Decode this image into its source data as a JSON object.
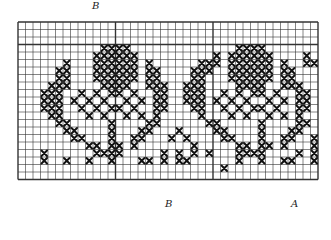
{
  "diagram": {
    "labels": {
      "top_b": "B",
      "bottom_b": "B",
      "bottom_a": "A"
    },
    "grid": {
      "cols": 40,
      "rows": 21,
      "cell_size": 7.5,
      "line_color": "#333333",
      "stitch_color": "#111111",
      "bold_every_col": [
        0,
        13,
        26,
        40
      ],
      "bold_row": 3
    },
    "pattern_rows": [
      "........................................",
      "........................................",
      "........................................",
      "...........XXXX..............XXXX.......",
      "..........XXXXXX..........X.XXXXXX....X.",
      "......X...XXXXXX.X......XXX.XXXXXX.X..XX",
      ".....XX...XXXXXX.XX....XXX..XXXXXX.XX...",
      ".....XX...XXXXXX.XX....XX...XXXXXX.XX...",
      "....XXX....XXXX..XXX..XXX....XXXX..XXX..",
      "...XXX..X.X.XX.X..XX..XXX..X.X.XX.X..XX.",
      "...XXX.X.X.X..X.X.XX..XXX.X.X.X..X.X.XX.",
      "...XXX..X.X.XX.X..XX...XX..X.X.XX.X..XX.",
      "....XX...X.X..X.X.X.....X...X.X..X.X.X..",
      ".....XX.....X....XX......XX.....X....XX.",
      "......XX....X...XX...X....XX....X...XX..",
      ".......XX...X..XX...X.X....XX...X..XX..X",
      ".........XX.XX.X.......X.....XX.XX.X...X",
      "...X......XXXX.....X.X.X.X...XXXX....X.X",
      "...X..X..X..X...XX.X.XX......X..X..XX..X",
      "...........................X............",
      "........................................"
    ]
  }
}
